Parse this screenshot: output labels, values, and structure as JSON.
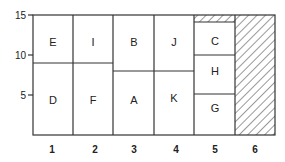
{
  "diagram": {
    "x_labels": [
      "1",
      "2",
      "3",
      "4",
      "5",
      "6"
    ],
    "y_labels": [
      "15",
      "10",
      "5"
    ],
    "cells": [
      {
        "label": "E",
        "col": 1,
        "y_range": [
          9,
          15
        ]
      },
      {
        "label": "D",
        "col": 1,
        "y_range": [
          0,
          9
        ]
      },
      {
        "label": "I",
        "col": 2,
        "y_range": [
          9,
          15
        ]
      },
      {
        "label": "F",
        "col": 2,
        "y_range": [
          0,
          9
        ]
      },
      {
        "label": "B",
        "col": 3,
        "y_range": [
          8,
          15
        ]
      },
      {
        "label": "A",
        "col": 3,
        "y_range": [
          0,
          8
        ]
      },
      {
        "label": "J",
        "col": 4,
        "y_range": [
          8,
          15
        ]
      },
      {
        "label": "K",
        "col": 4,
        "y_range": [
          0,
          8
        ]
      },
      {
        "label": "C",
        "col": 5,
        "y_range": [
          10,
          14
        ]
      },
      {
        "label": "H",
        "col": 5,
        "y_range": [
          5,
          10
        ]
      },
      {
        "label": "G",
        "col": 5,
        "y_range": [
          0,
          5
        ]
      }
    ],
    "hatched": [
      {
        "col": 5,
        "y_range": [
          14,
          15
        ]
      },
      {
        "col": 6,
        "y_range": [
          0,
          15
        ]
      }
    ]
  }
}
